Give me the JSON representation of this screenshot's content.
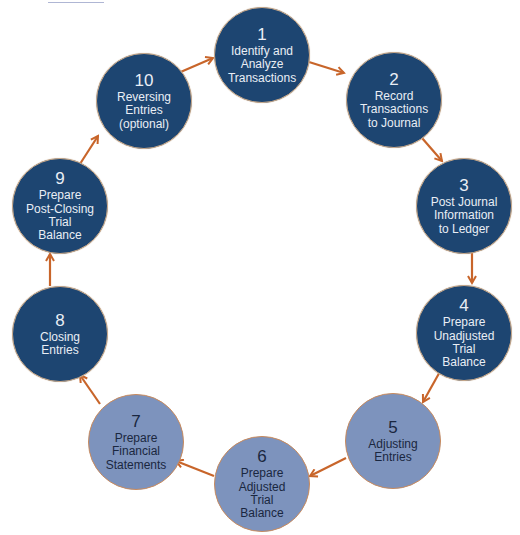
{
  "diagram": {
    "colors": {
      "dark_step": "#1d4571",
      "light_step": "#7d93bd",
      "arrow": "#c8652a",
      "dark_text": "#e9eef5",
      "light_text": "#1a2740"
    },
    "steps": [
      {
        "number": "1",
        "label": "Identify and\nAnalyze\nTransactions",
        "style": "dark"
      },
      {
        "number": "2",
        "label": "Record\nTransactions\nto Journal",
        "style": "dark"
      },
      {
        "number": "3",
        "label": "Post Journal\nInformation\nto Ledger",
        "style": "dark"
      },
      {
        "number": "4",
        "label": "Prepare\nUnadjusted\nTrial\nBalance",
        "style": "dark"
      },
      {
        "number": "5",
        "label": "Adjusting\nEntries",
        "style": "light"
      },
      {
        "number": "6",
        "label": "Prepare\nAdjusted\nTrial\nBalance",
        "style": "light"
      },
      {
        "number": "7",
        "label": "Prepare\nFinancial\nStatements",
        "style": "light"
      },
      {
        "number": "8",
        "label": "Closing\nEntries",
        "style": "dark"
      },
      {
        "number": "9",
        "label": "Prepare\nPost-Closing\nTrial\nBalance",
        "style": "dark"
      },
      {
        "number": "10",
        "label": "Reversing\nEntries\n(optional)",
        "style": "dark"
      }
    ],
    "flow": [
      "1→2",
      "2→3",
      "3→4",
      "4→5",
      "5→6",
      "6→7",
      "7→8",
      "8→9",
      "9→10",
      "10→1"
    ]
  }
}
